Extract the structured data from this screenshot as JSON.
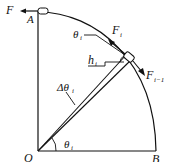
{
  "diagram": {
    "labels": {
      "F": "F",
      "A": "A",
      "B": "B",
      "O": "O",
      "theta_top": "θ",
      "theta_top_sub": "i",
      "F_i": "F",
      "F_i_sub": "i",
      "F_im1": "F",
      "F_im1_sub": "i−1",
      "h_i": "h",
      "h_i_sub": "i",
      "delta_theta": "Δθ",
      "delta_theta_sub": "i",
      "theta_origin": "θ",
      "theta_origin_sub": "i"
    },
    "colors": {
      "stroke": "#111111",
      "background": "#ffffff"
    }
  }
}
